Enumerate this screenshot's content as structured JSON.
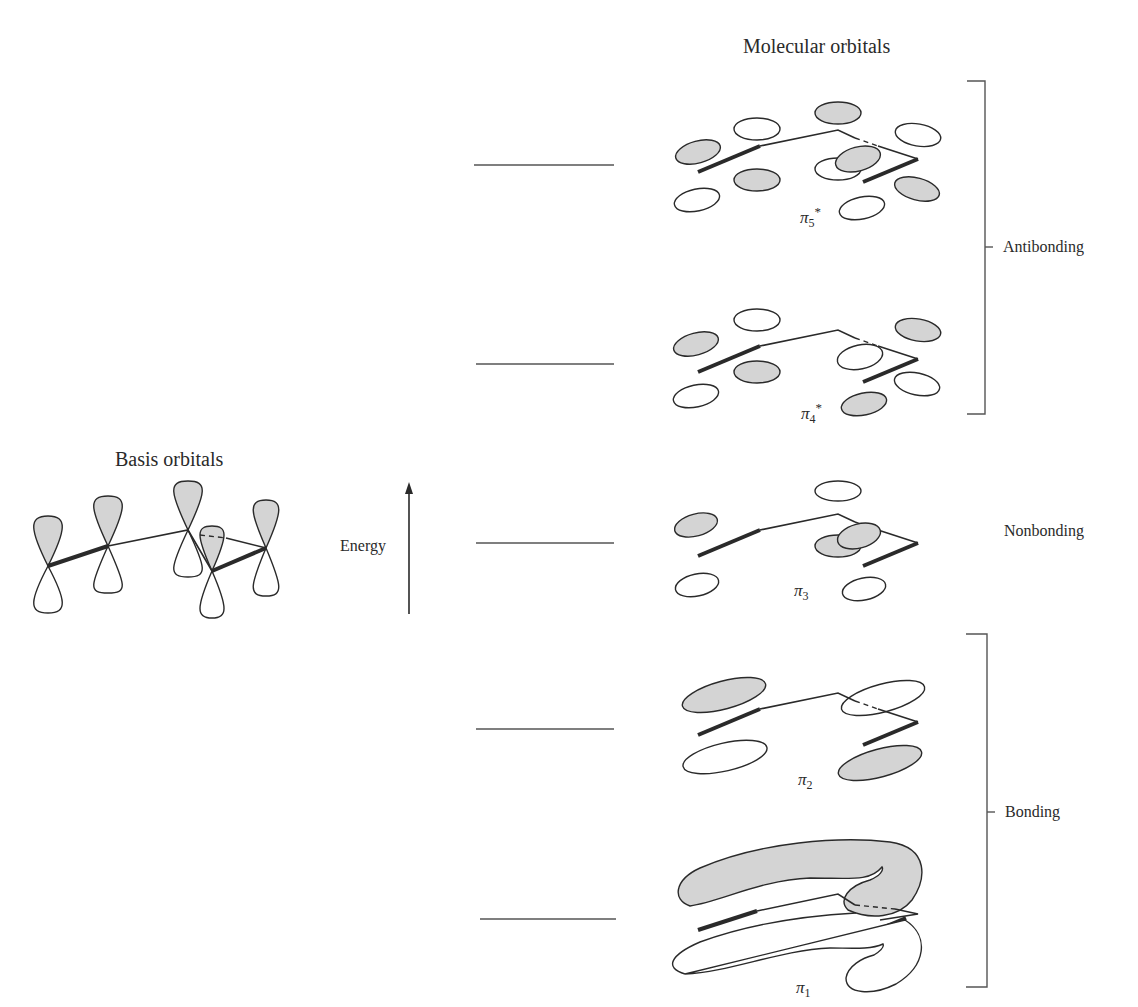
{
  "titles": {
    "molecular": "Molecular orbitals",
    "basis": "Basis orbitals"
  },
  "axis": {
    "label": "Energy"
  },
  "groups": {
    "antibonding": "Antibonding",
    "nonbonding": "Nonbonding",
    "bonding": "Bonding"
  },
  "orbitals": [
    {
      "symbol": "π",
      "index": "5",
      "star": "*",
      "level_y": 165,
      "type": "antibonding"
    },
    {
      "symbol": "π",
      "index": "4",
      "star": "*",
      "level_y": 364,
      "type": "antibonding"
    },
    {
      "symbol": "π",
      "index": "3",
      "star": "",
      "level_y": 543,
      "type": "nonbonding"
    },
    {
      "symbol": "π",
      "index": "2",
      "star": "",
      "level_y": 729,
      "type": "bonding"
    },
    {
      "symbol": "π",
      "index": "1",
      "star": "",
      "level_y": 919,
      "type": "bonding"
    }
  ],
  "colors": {
    "lobe_fill": "#d4d4d4",
    "line": "#2a2a2a",
    "background": "#ffffff"
  }
}
